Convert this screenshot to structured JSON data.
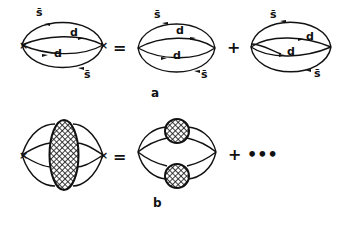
{
  "figure": {
    "row_a": {
      "caption": "a",
      "equals": "=",
      "plus": "+",
      "diagrams": [
        {
          "name": "full-diagram",
          "labels": [
            {
              "text": "s̄",
              "x": 36,
              "y": 16
            },
            {
              "text": "d",
              "x": 70,
              "y": 36
            },
            {
              "text": "d",
              "x": 54,
              "y": 57
            },
            {
              "text": "s̄",
              "x": 84,
              "y": 78
            }
          ]
        },
        {
          "name": "direct-term",
          "labels": [
            {
              "text": "s̄",
              "x": 154,
              "y": 18
            },
            {
              "text": "d",
              "x": 176,
              "y": 34
            },
            {
              "text": "d",
              "x": 173,
              "y": 59
            },
            {
              "text": "s̄",
              "x": 201,
              "y": 78
            }
          ]
        },
        {
          "name": "crossed-term",
          "labels": [
            {
              "text": "s̄",
              "x": 270,
              "y": 18
            },
            {
              "text": "d",
              "x": 306,
              "y": 40
            },
            {
              "text": "d",
              "x": 287,
              "y": 55
            },
            {
              "text": "s̄",
              "x": 314,
              "y": 77
            }
          ]
        }
      ]
    },
    "row_b": {
      "caption": "b",
      "equals": "=",
      "continuation": "+ •••"
    }
  }
}
